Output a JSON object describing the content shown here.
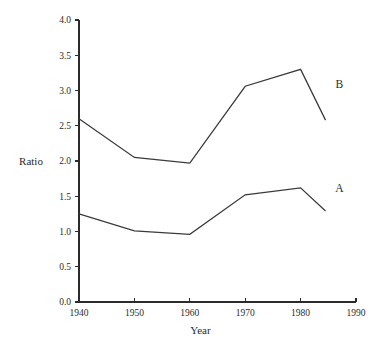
{
  "chart_data": {
    "type": "line",
    "title": "",
    "xlabel": "Year",
    "ylabel": "Ratio",
    "xlim": [
      1940,
      1990
    ],
    "ylim": [
      0.0,
      4.0
    ],
    "grid": false,
    "legend_position": "inline-right-end-labels",
    "x_ticks": [
      1940,
      1950,
      1960,
      1970,
      1980,
      1990
    ],
    "x_tick_labels": [
      "1940",
      "1950",
      "1960",
      "1970",
      "1980",
      "1990"
    ],
    "y_ticks": [
      0.0,
      0.5,
      1.0,
      1.5,
      2.0,
      2.5,
      3.0,
      3.5,
      4.0
    ],
    "y_tick_labels": [
      "0.0",
      "0.5",
      "1.0",
      "1.5",
      "2.0",
      "2.5",
      "3.0",
      "3.5",
      "4.0"
    ],
    "x": [
      1940,
      1950,
      1960,
      1970,
      1980,
      1984.5
    ],
    "series": [
      {
        "name": "B",
        "label": "B",
        "color": "#3a3a3a",
        "values": [
          2.6,
          2.05,
          1.97,
          3.06,
          3.3,
          2.58
        ],
        "label_x": 1987,
        "label_y": 3.04
      },
      {
        "name": "A",
        "label": "A",
        "color": "#3a3a3a",
        "values": [
          1.25,
          1.01,
          0.96,
          1.52,
          1.62,
          1.29
        ],
        "label_x": 1987,
        "label_y": 1.56
      }
    ]
  },
  "labels": {
    "y_axis_title": "Ratio",
    "x_axis_title": "Year",
    "series_b": "B",
    "series_a": "A"
  },
  "colors": {
    "background": "#ffffff",
    "ink": "#2b2b2b",
    "line": "#3a3a3a"
  }
}
